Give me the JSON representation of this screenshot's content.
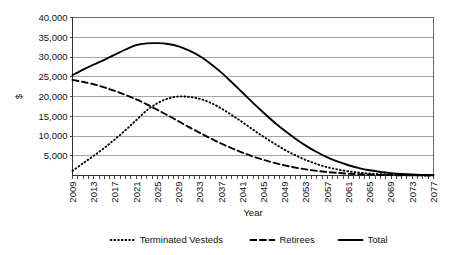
{
  "chart_data": {
    "type": "line",
    "title": "",
    "xlabel": "Year",
    "ylabel": "$",
    "xlim": [
      2009,
      2077
    ],
    "ylim": [
      0,
      40000
    ],
    "grid": true,
    "legend_position": "bottom",
    "ytick_labels": [
      "40,000",
      "35,000",
      "30,000",
      "25,000",
      "20,000",
      "15,000",
      "10,000",
      "5,000"
    ],
    "ytick_values": [
      40000,
      35000,
      30000,
      25000,
      20000,
      15000,
      10000,
      5000
    ],
    "xtick_labels": [
      "2009",
      "2013",
      "2017",
      "2021",
      "2025",
      "2029",
      "2033",
      "2037",
      "2041",
      "2045",
      "2049",
      "2053",
      "2057",
      "2061",
      "2065",
      "2069",
      "2073",
      "2077"
    ],
    "xtick_values": [
      2009,
      2013,
      2017,
      2021,
      2025,
      2029,
      2033,
      2037,
      2041,
      2045,
      2049,
      2053,
      2057,
      2061,
      2065,
      2069,
      2073,
      2077
    ],
    "x": [
      2009,
      2011,
      2013,
      2015,
      2017,
      2019,
      2021,
      2023,
      2025,
      2027,
      2029,
      2031,
      2033,
      2035,
      2037,
      2039,
      2041,
      2043,
      2045,
      2047,
      2049,
      2051,
      2053,
      2055,
      2057,
      2059,
      2061,
      2063,
      2065,
      2067,
      2069,
      2071,
      2073,
      2075,
      2077
    ],
    "series": [
      {
        "name": "Terminated Vesteds",
        "style": "dotted",
        "color": "#000000",
        "values": [
          1200,
          3100,
          5000,
          7000,
          9200,
          11500,
          14000,
          16500,
          18300,
          19500,
          20000,
          19900,
          19400,
          18400,
          17000,
          15300,
          13500,
          11600,
          9800,
          8100,
          6500,
          5100,
          3900,
          2900,
          2100,
          1500,
          1050,
          720,
          480,
          320,
          200,
          130,
          80,
          50,
          30
        ]
      },
      {
        "name": "Retirees",
        "style": "dashed",
        "color": "#000000",
        "values": [
          24200,
          23700,
          23100,
          22300,
          21400,
          20400,
          19300,
          18000,
          16600,
          15200,
          13700,
          12200,
          10800,
          9400,
          8100,
          6900,
          5800,
          4800,
          3950,
          3200,
          2550,
          2000,
          1550,
          1180,
          880,
          640,
          460,
          320,
          215,
          140,
          90,
          55,
          35,
          20,
          12
        ]
      },
      {
        "name": "Total",
        "style": "solid",
        "color": "#000000",
        "values": [
          25400,
          26800,
          28100,
          29300,
          30600,
          31900,
          33000,
          33450,
          33500,
          33300,
          32700,
          31600,
          30200,
          28300,
          26100,
          23600,
          21000,
          18400,
          15900,
          13500,
          11300,
          9300,
          7500,
          5950,
          4600,
          3500,
          2600,
          1880,
          1320,
          900,
          600,
          390,
          240,
          150,
          90
        ]
      }
    ],
    "legend": [
      {
        "label": "Terminated Vesteds",
        "style": "dotted"
      },
      {
        "label": "Retirees",
        "style": "dashed"
      },
      {
        "label": "Total",
        "style": "solid"
      }
    ]
  }
}
